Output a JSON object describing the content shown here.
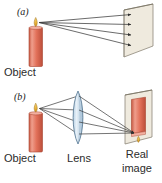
{
  "figure": {
    "background_color": "#ffffff",
    "width": 162,
    "height": 183
  },
  "colors": {
    "candle_body": "#e2715a",
    "candle_body_light": "#f0a08e",
    "candle_body_dark": "#c0503c",
    "flame": "#f2c14a",
    "flame_core": "#d89a22",
    "screen_face": "#efeade",
    "screen_edge": "#b9b2a0",
    "lens_fill": "#cfe0ef",
    "lens_stroke": "#6f8aa3",
    "ray": "#3a3a3a",
    "text": "#2b2b2b",
    "image_screen_face": "#efeade",
    "image_candle": "#e2715a"
  },
  "panel_a": {
    "label": "(a)",
    "object_caption": "Object",
    "ray_count": 4,
    "description": "Rays from the candle tip spread out and strike a screen; no image forms."
  },
  "panel_b": {
    "label": "(b)",
    "object_caption": "Object",
    "lens_caption": "Lens",
    "image_caption_line1": "Real",
    "image_caption_line2": "image",
    "ray_count": 4,
    "description": "Rays from the candle tip are refracted by a converging lens and converge on a screen, forming an inverted real image."
  }
}
